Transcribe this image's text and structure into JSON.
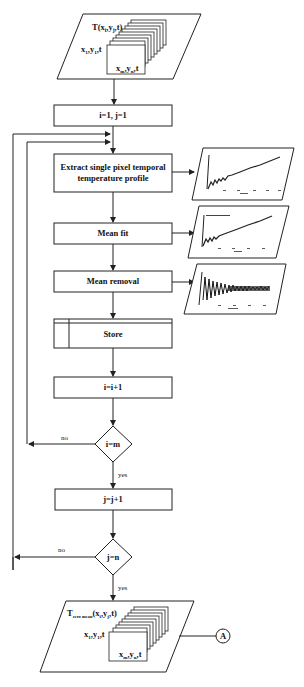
{
  "flowchart": {
    "input": {
      "label": "T(x",
      "label_full": "T(xi,yj,t)",
      "first_frame": "x1,y1,t",
      "last_frame": "xm,yn,t"
    },
    "init": {
      "label": "i=1, j=1"
    },
    "extract": {
      "line1": "Extract single pixel temporal",
      "line2": "temperature profile"
    },
    "mean_fit": {
      "label": "Mean fit"
    },
    "mean_removal": {
      "label": "Mean removal"
    },
    "store": {
      "label": "Store"
    },
    "inc_i": {
      "label": "i=i+1"
    },
    "check_i": {
      "label": "i=m",
      "no": "no",
      "yes": "yes"
    },
    "inc_j": {
      "label": "j=j+1"
    },
    "check_j": {
      "label": "j=n",
      "no": "no",
      "yes": "yes"
    },
    "output": {
      "label_full": "Tzero mean(xi,yj,t)",
      "first_frame": "x1,y1,t",
      "last_frame": "xm,yn,t"
    },
    "connector": {
      "label": "A"
    }
  },
  "thumbnails": [
    {
      "name": "raw-temporal-profile",
      "kind": "rising-oscillating-curve"
    },
    {
      "name": "mean-fit-plot",
      "kind": "rising-curve-with-fit"
    },
    {
      "name": "mean-removed-plot",
      "kind": "decaying-oscillation"
    }
  ]
}
